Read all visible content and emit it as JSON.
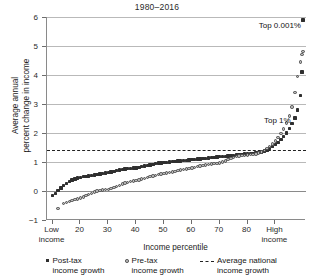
{
  "chart_data": {
    "type": "scatter",
    "title": "1980–2016",
    "xlabel": "Income percentile",
    "ylabel": "Average annual\npercent change in income",
    "xlim": [
      8,
      101
    ],
    "ylim": [
      -1,
      6
    ],
    "grid": true,
    "yticks": [
      -1,
      0,
      1,
      2,
      3,
      4,
      5,
      6
    ],
    "ytick_labels": [
      "−1",
      "0",
      "1",
      "2",
      "3",
      "4",
      "5",
      "6"
    ],
    "xticks": [
      10,
      20,
      30,
      40,
      50,
      60,
      70,
      80,
      90
    ],
    "xtick_labels": [
      "Low\nincome",
      "20",
      "30",
      "40",
      "50",
      "60",
      "70",
      "80",
      "High\nincome"
    ],
    "legend_position": "below-axes",
    "annotations": [
      {
        "text": "Top 0.001%",
        "x": 99.2,
        "y": 5.72,
        "align": "right"
      },
      {
        "text": "Top 1%",
        "x": 95.5,
        "y": 2.45,
        "align": "right"
      }
    ],
    "reference_line": {
      "label": "Average national income growth",
      "value": 1.4,
      "style": "dashed"
    },
    "series": [
      {
        "name": "Post-tax income growth",
        "marker": "filled-square",
        "color": "#2f2f2f",
        "x": [
          10,
          11,
          12,
          13,
          14,
          15,
          16,
          17,
          18,
          19,
          20,
          21,
          22,
          23,
          24,
          25,
          26,
          27,
          28,
          29,
          30,
          31,
          32,
          33,
          34,
          35,
          36,
          37,
          38,
          39,
          40,
          41,
          42,
          43,
          44,
          45,
          46,
          47,
          48,
          49,
          50,
          51,
          52,
          53,
          54,
          55,
          56,
          57,
          58,
          59,
          60,
          61,
          62,
          63,
          64,
          65,
          66,
          67,
          68,
          69,
          70,
          71,
          72,
          73,
          74,
          75,
          76,
          77,
          78,
          79,
          80,
          81,
          82,
          83,
          84,
          85,
          86,
          87,
          88,
          89,
          90,
          91,
          92,
          93,
          94,
          95,
          96,
          97,
          98,
          99,
          99.5,
          99.9
        ],
        "y": [
          -0.15,
          -0.08,
          0.02,
          0.1,
          0.18,
          0.26,
          0.33,
          0.38,
          0.42,
          0.45,
          0.47,
          0.49,
          0.51,
          0.52,
          0.53,
          0.55,
          0.56,
          0.58,
          0.6,
          0.62,
          0.64,
          0.66,
          0.68,
          0.7,
          0.72,
          0.74,
          0.76,
          0.77,
          0.78,
          0.79,
          0.8,
          0.82,
          0.84,
          0.86,
          0.88,
          0.9,
          0.92,
          0.94,
          0.96,
          0.97,
          0.98,
          0.99,
          1.0,
          1.01,
          1.02,
          1.03,
          1.04,
          1.05,
          1.06,
          1.07,
          1.08,
          1.09,
          1.1,
          1.11,
          1.12,
          1.13,
          1.14,
          1.15,
          1.16,
          1.17,
          1.18,
          1.19,
          1.2,
          1.21,
          1.22,
          1.23,
          1.24,
          1.25,
          1.26,
          1.27,
          1.28,
          1.29,
          1.3,
          1.31,
          1.33,
          1.35,
          1.38,
          1.42,
          1.47,
          1.53,
          1.6,
          1.68,
          1.78,
          1.88,
          2.0,
          2.15,
          2.32,
          2.52,
          2.8,
          3.3,
          4.1,
          5.9
        ]
      },
      {
        "name": "Pre-tax income growth",
        "marker": "open-circle",
        "color": "#b9b9b9",
        "x": [
          12,
          14,
          15,
          16,
          17,
          18,
          19,
          20,
          21,
          22,
          23,
          24,
          25,
          26,
          27,
          28,
          29,
          30,
          31,
          32,
          33,
          34,
          35,
          36,
          37,
          38,
          39,
          40,
          41,
          42,
          43,
          44,
          45,
          46,
          47,
          48,
          49,
          50,
          51,
          52,
          53,
          54,
          55,
          56,
          57,
          58,
          59,
          60,
          61,
          62,
          63,
          64,
          65,
          66,
          67,
          68,
          69,
          70,
          71,
          72,
          73,
          74,
          75,
          76,
          77,
          78,
          79,
          80,
          81,
          82,
          83,
          84,
          85,
          86,
          87,
          88,
          89,
          90,
          91,
          92,
          93,
          94,
          95,
          96,
          97,
          98,
          99,
          99.5,
          99.9
        ],
        "y": [
          -0.6,
          -0.44,
          -0.4,
          -0.36,
          -0.33,
          -0.3,
          -0.27,
          -0.24,
          -0.2,
          -0.16,
          -0.12,
          -0.08,
          -0.04,
          0.0,
          0.02,
          0.04,
          0.05,
          0.06,
          0.08,
          0.12,
          0.16,
          0.2,
          0.24,
          0.27,
          0.3,
          0.32,
          0.34,
          0.36,
          0.38,
          0.41,
          0.44,
          0.47,
          0.5,
          0.52,
          0.54,
          0.56,
          0.58,
          0.6,
          0.62,
          0.64,
          0.66,
          0.68,
          0.7,
          0.72,
          0.74,
          0.76,
          0.78,
          0.8,
          0.82,
          0.84,
          0.86,
          0.88,
          0.9,
          0.92,
          0.93,
          0.94,
          0.95,
          0.97,
          1.0,
          1.04,
          1.08,
          1.12,
          1.16,
          1.19,
          1.21,
          1.22,
          1.23,
          1.24,
          1.25,
          1.26,
          1.28,
          1.31,
          1.35,
          1.4,
          1.46,
          1.53,
          1.62,
          1.72,
          1.84,
          1.98,
          2.14,
          2.34,
          2.58,
          2.9,
          3.4,
          3.95,
          4.45,
          4.7,
          4.82
        ]
      }
    ]
  },
  "legend": {
    "items": [
      {
        "marker": "filled-square",
        "line1": "Post-tax",
        "line2": "income growth"
      },
      {
        "marker": "open-circle",
        "line1": "Pre-tax",
        "line2": "income growth"
      },
      {
        "marker": "dashed-line",
        "line1": "Average national",
        "line2": "income growth"
      }
    ]
  }
}
